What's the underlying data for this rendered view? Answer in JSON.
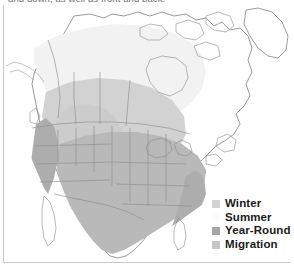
{
  "caption": {
    "text": "and down, as well as front and back."
  },
  "map": {
    "title": "North America bird range map",
    "regions_shown": [
      "Alaska",
      "Canada",
      "United States",
      "Mexico",
      "Greenland"
    ],
    "background_color": "#ffffff",
    "outline_color": "#6e6e6e",
    "frame_color": "#c9c9c9"
  },
  "legend": {
    "items": [
      {
        "label": "Winter",
        "color": "#d2d2d2",
        "description": "Winter range"
      },
      {
        "label": "Summer",
        "color": "#fbfbfb",
        "description": "Summer breeding range"
      },
      {
        "label": "Year-Round",
        "color": "#a6a6a6",
        "description": "Year-round resident range"
      },
      {
        "label": "Migration",
        "color": "#c4c4c4",
        "description": "Migration corridor"
      }
    ]
  },
  "shading_colors": {
    "winter": "#d2d2d2",
    "summer": "#f2f2f2",
    "year_round": "#b9b9b9",
    "migration": "#cccccc",
    "coastal_dark": "#adadad"
  }
}
